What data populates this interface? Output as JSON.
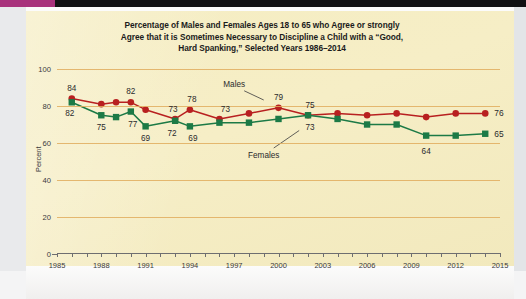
{
  "chart_data": {
    "type": "line",
    "title": "Percentage of Males and Females Ages 18 to 65 who Agree or strongly Agree that it is Sometimes Necessary to Discipline a Child with a “Good, Hard Spanking,” Selected Years 1986–2014",
    "title_lines": [
      "Percentage of Males and Females Ages 18 to 65 who Agree or strongly",
      "Agree that it is Sometimes Necessary to Discipline a Child with a “Good,",
      "Hard Spanking,” Selected Years 1986–2014"
    ],
    "xlabel": "",
    "ylabel": "Percent",
    "xlim": [
      1985,
      2015
    ],
    "ylim": [
      0,
      100
    ],
    "grid": true,
    "legend_position": "inline-annotation",
    "x": [
      1986,
      1988,
      1989,
      1990,
      1991,
      1993,
      1994,
      1996,
      1998,
      2000,
      2002,
      2004,
      2006,
      2008,
      2010,
      2012,
      2014
    ],
    "series": [
      {
        "name": "Males",
        "color": "#b82020",
        "marker": "circle",
        "values": [
          84,
          81,
          82,
          82,
          78,
          73,
          78,
          73,
          76,
          79,
          75,
          76,
          75,
          76,
          74,
          76,
          76
        ]
      },
      {
        "name": "Females",
        "color": "#1c7a46",
        "marker": "square",
        "values": [
          82,
          75,
          74,
          77,
          69,
          72,
          69,
          71,
          71,
          73,
          75,
          73,
          70,
          70,
          64,
          64,
          65
        ]
      }
    ],
    "point_labels": [
      {
        "series": "Males",
        "x": 1986,
        "value": 84,
        "text": "84",
        "dx": 0,
        "dy": -11
      },
      {
        "series": "Males",
        "x": 1990,
        "value": 82,
        "text": "82",
        "dx": 0,
        "dy": -11
      },
      {
        "series": "Males",
        "x": 1993,
        "value": 73,
        "text": "73",
        "dx": -2,
        "dy": -10
      },
      {
        "series": "Males",
        "x": 1994,
        "value": 78,
        "text": "78",
        "dx": 2,
        "dy": -11
      },
      {
        "series": "Males",
        "x": 1996,
        "value": 73,
        "text": "73",
        "dx": 6,
        "dy": -10
      },
      {
        "series": "Males",
        "x": 2000,
        "value": 79,
        "text": "79",
        "dx": 0,
        "dy": -11
      },
      {
        "series": "Males",
        "x": 2002,
        "value": 75,
        "text": "75",
        "dx": 2,
        "dy": -10
      },
      {
        "series": "Females",
        "x": 1986,
        "value": 82,
        "text": "82",
        "dx": -2,
        "dy": 11
      },
      {
        "series": "Females",
        "x": 1988,
        "value": 75,
        "text": "75",
        "dx": 0,
        "dy": 12
      },
      {
        "series": "Females",
        "x": 1990,
        "value": 77,
        "text": "77",
        "dx": 2,
        "dy": 12
      },
      {
        "series": "Females",
        "x": 1991,
        "value": 69,
        "text": "69",
        "dx": 0,
        "dy": 12
      },
      {
        "series": "Females",
        "x": 1993,
        "value": 72,
        "text": "72",
        "dx": -3,
        "dy": 12
      },
      {
        "series": "Females",
        "x": 1994,
        "value": 69,
        "text": "69",
        "dx": 3,
        "dy": 12
      },
      {
        "series": "Females",
        "x": 2002,
        "value": 75,
        "text": "73",
        "dx": 2,
        "dy": 12
      },
      {
        "series": "Females",
        "x": 2010,
        "value": 64,
        "text": "64",
        "dx": 0,
        "dy": 15
      }
    ],
    "end_labels": [
      {
        "series": "Males",
        "text": "76",
        "value": 76
      },
      {
        "series": "Females",
        "text": "65",
        "value": 65
      }
    ],
    "annotations": [
      {
        "text": "Males",
        "x": 1997,
        "y": 92,
        "leader_to_x": 1999,
        "leader_to_y": 80
      },
      {
        "text": "Females",
        "x": 1999,
        "y": 53.5,
        "leader_to_x": 2001.4,
        "leader_to_y": 70
      }
    ],
    "yticks": [
      0,
      20,
      40,
      60,
      80,
      100
    ],
    "xticks_major": [
      1985,
      1988,
      1991,
      1994,
      1997,
      2000,
      2003,
      2006,
      2009,
      2012,
      2015
    ],
    "xticks_minor": [
      1986,
      1987,
      1989,
      1990,
      1992,
      1993,
      1995,
      1996,
      1998,
      1999,
      2001,
      2002,
      2004,
      2005,
      2007,
      2008,
      2010,
      2011,
      2013,
      2014
    ],
    "colors": {
      "panel": "#f5edc2",
      "gridline": "#e0ad5e",
      "males": "#b82020",
      "females": "#1c7a46",
      "axis": "#6e6e70",
      "text": "#2a2a2c"
    }
  }
}
